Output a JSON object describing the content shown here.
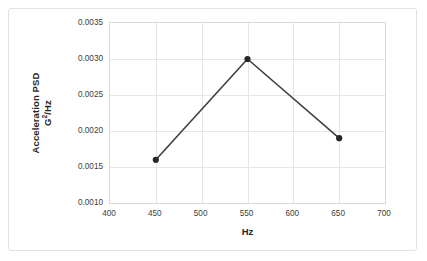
{
  "chart_data": {
    "type": "line",
    "title": "",
    "subtitle": "",
    "xlabel": "Hz",
    "ylabel_line1": "Acceleration PSD",
    "ylabel_line2_base": "G",
    "ylabel_line2_sup": "2",
    "ylabel_line2_tail": "/Hz",
    "ylabel": "Acceleration PSD G2/Hz",
    "x": [
      450,
      550,
      650
    ],
    "values": [
      0.0016,
      0.003,
      0.0019
    ],
    "series": [
      {
        "name": "Acceleration PSD",
        "values": [
          0.0016,
          0.003,
          0.0019
        ]
      }
    ],
    "xlim": [
      400,
      700
    ],
    "ylim": [
      0.001,
      0.0035
    ],
    "xticks": [
      400,
      450,
      500,
      550,
      600,
      650,
      700
    ],
    "xtick_labels": [
      "400",
      "450",
      "500",
      "550",
      "600",
      "650",
      "700"
    ],
    "yticks": [
      0.001,
      0.0015,
      0.002,
      0.0025,
      0.003,
      0.0035
    ],
    "ytick_labels": [
      "0.0010",
      "0.0015",
      "0.0020",
      "0.0025",
      "0.0030",
      "0.0035"
    ],
    "grid": true,
    "grid_color": "#e6e6e6",
    "legend": false,
    "legend_position": "none",
    "line_color": "#404040",
    "marker_color": "#262626",
    "marker": "circle",
    "plot_background": "#ffffff",
    "border_color": "#d9d9d9"
  }
}
